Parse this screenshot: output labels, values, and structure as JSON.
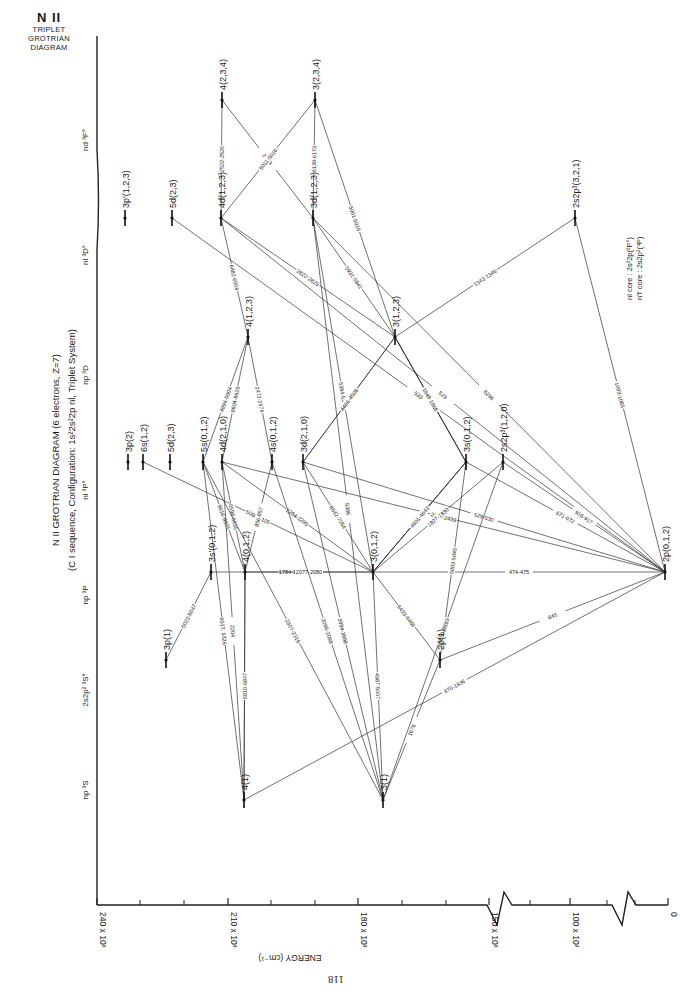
{
  "corner_title": {
    "ion": "N II",
    "line1": "TRIPLET",
    "line2": "GROTRIAN",
    "line3": "DIAGRAM"
  },
  "title": {
    "line1": "N II GROTRIAN DIAGRAM (6 electrons, Z=7)",
    "line2": "(C I sequence, Configuration: 1s²2s²2p nl, Triplet System)"
  },
  "legend_note": {
    "line1": "nl   core : 2s²2p(²P°)",
    "line2": "n'l' core : 2s2p²(⁴P)"
  },
  "page_number": "118",
  "axis": {
    "label": "ENERGY   (cm⁻¹)",
    "ticks": [
      {
        "label": "240 x 10³",
        "x": 97
      },
      {
        "label": "210 x 10³",
        "x": 228
      },
      {
        "label": "180 x 10³",
        "x": 358
      },
      {
        "label": "150 x 10³",
        "x": 489
      },
      {
        "label": "100 x 10³",
        "x": 570
      },
      {
        "label": "0",
        "x": 668
      }
    ],
    "minor_ticks_x": [
      140,
      184,
      271,
      315,
      402,
      446,
      530,
      607,
      635
    ]
  },
  "columns": [
    {
      "label": "np ³S",
      "y": 790
    },
    {
      "label": "2s2p² ³S°",
      "y": 690
    },
    {
      "label": "np ³P",
      "y": 595
    },
    {
      "label": "nl ³P°",
      "y": 490
    },
    {
      "label": "np ³D",
      "y": 375
    },
    {
      "label": "nl ³D°",
      "y": 255
    },
    {
      "label": "nd ³F°",
      "y": 140
    }
  ],
  "chart_data": {
    "type": "grotrian",
    "title": "N II GROTRIAN DIAGRAM (6 electrons, Z=7)",
    "subtitle": "(C I sequence, Configuration: 1s²2s²2p nl, Triplet System)",
    "xlabel": "ENERGY (cm⁻¹)",
    "xlim": [
      240000,
      0
    ],
    "columns": [
      "np ³S",
      "2s2p² ³S°",
      "np ³P",
      "nl ³P°",
      "np ³D",
      "nl ³D°",
      "nd ³F°"
    ],
    "levels": [
      {
        "id": "4F",
        "label": "4(2,3,4)",
        "column": "nd ³F°",
        "x": 222,
        "y": 100
      },
      {
        "id": "3F",
        "label": "3(2,3,4)",
        "column": "nd ³F°",
        "x": 315,
        "y": 100
      },
      {
        "id": "3pp",
        "label": "3p'(1,2,3)",
        "column": "nl ³D°",
        "x": 125,
        "y": 218
      },
      {
        "id": "5dD",
        "label": "5d(2,3)",
        "column": "nl ³D°",
        "x": 172,
        "y": 218
      },
      {
        "id": "4dD",
        "label": "4d(1,2,3)",
        "column": "nl ³D°",
        "x": 221,
        "y": 218
      },
      {
        "id": "3dD",
        "label": "3d(1,2,3)",
        "column": "nl ³D°",
        "x": 313,
        "y": 218
      },
      {
        "id": "2s2p3D",
        "label": "2s2p³(3,2,1)",
        "column": "nl ³D°",
        "x": 575,
        "y": 218
      },
      {
        "id": "4pD",
        "label": "4(1,2,3)",
        "column": "np ³D",
        "x": 248,
        "y": 337
      },
      {
        "id": "3pD",
        "label": "3(1,2,3)",
        "column": "np ³D",
        "x": 395,
        "y": 337
      },
      {
        "id": "3pP",
        "label": "3p(2)",
        "column": "nl ³P°",
        "x": 128,
        "y": 462
      },
      {
        "id": "6s",
        "label": "6s(1,2)",
        "column": "nl ³P°",
        "x": 143,
        "y": 462
      },
      {
        "id": "5dP",
        "label": "5d(2,3)",
        "column": "nl ³P°",
        "x": 170,
        "y": 462
      },
      {
        "id": "5s",
        "label": "5s(0,1,2)",
        "column": "nl ³P°",
        "x": 203,
        "y": 462
      },
      {
        "id": "4dP",
        "label": "4d(2,1,0)",
        "column": "nl ³P°",
        "x": 222,
        "y": 462
      },
      {
        "id": "4s",
        "label": "4s(0,1,2)",
        "column": "nl ³P°",
        "x": 272,
        "y": 462
      },
      {
        "id": "3dP",
        "label": "3d(2,1,0)",
        "column": "nl ³P°",
        "x": 303,
        "y": 462
      },
      {
        "id": "3s",
        "label": "3s(0,1,2)",
        "column": "nl ³P°",
        "x": 466,
        "y": 462
      },
      {
        "id": "2s2p3P",
        "label": "2s2p³(1,2,0)",
        "column": "nl ³P°",
        "x": 503,
        "y": 462
      },
      {
        "id": "3sp",
        "label": "3s'(0,1,2)",
        "column": "np ³P",
        "x": 211,
        "y": 572
      },
      {
        "id": "4pP",
        "label": "4(0,1,2)",
        "column": "np ³P",
        "x": 245,
        "y": 572
      },
      {
        "id": "3pPP",
        "label": "3(0,1,2)",
        "column": "np ³P",
        "x": 373,
        "y": 572
      },
      {
        "id": "2pP",
        "label": "2p(0,1,2)",
        "column": "np ³P",
        "x": 665,
        "y": 572
      },
      {
        "id": "3p1",
        "label": "3p(1)",
        "column": "2s2p² ³S°",
        "x": 166,
        "y": 660
      },
      {
        "id": "2p1",
        "label": "2p(1)",
        "column": "2s2p² ³S°",
        "x": 440,
        "y": 660
      },
      {
        "id": "4S",
        "label": "4(1)",
        "column": "np ³S",
        "x": 244,
        "y": 800
      },
      {
        "id": "3S",
        "label": "3(1)",
        "column": "np ³S",
        "x": 383,
        "y": 800
      }
    ],
    "transitions": [
      {
        "from": "4F",
        "to": "3dD",
        "label": "2509"
      },
      {
        "from": "4F",
        "to": "4dD",
        "label": "2522-2526"
      },
      {
        "from": "3F",
        "to": "3dD",
        "label": "6139-6173"
      },
      {
        "from": "3F",
        "to": "3pD",
        "label": "5001-5016"
      },
      {
        "from": "3F",
        "to": "4dD",
        "label": "5011-5016"
      },
      {
        "from": "5dD",
        "label": "533",
        "to": "2pP"
      },
      {
        "from": "4dD",
        "to": "4pD",
        "label": "6482-6504"
      },
      {
        "from": "4dD",
        "label": "529",
        "to": "2pP"
      },
      {
        "from": "4dD",
        "to": "3pD",
        "label": "2822-2826"
      },
      {
        "from": "3dD",
        "to": "3pD",
        "label": "5931-5941"
      },
      {
        "from": "3dD",
        "to": "3pPP",
        "label": "5384-5391"
      },
      {
        "from": "3dD",
        "to": "3S",
        "label": "5386"
      },
      {
        "from": "3dD",
        "label": "6286",
        "to": "2pP"
      },
      {
        "from": "2s2p3D",
        "to": "2pP",
        "label": "1083-1085"
      },
      {
        "from": "2s2p3D",
        "to": "3pD",
        "label": "1343-1346"
      },
      {
        "from": "4pD",
        "to": "5s",
        "label": "4994-5004"
      },
      {
        "from": "4pD",
        "to": "4dP",
        "label": "8604-8629"
      },
      {
        "from": "4pD",
        "to": "4s",
        "label": "2472-2474"
      },
      {
        "from": "3pD",
        "to": "3dP",
        "label": "2091-2097"
      },
      {
        "from": "3pD",
        "to": "3s",
        "label": "5667-5711"
      },
      {
        "from": "3pD",
        "to": "3dP",
        "label": "4466-4508"
      },
      {
        "from": "3pD",
        "to": "3s",
        "label": "3838-3855"
      },
      {
        "from": "6s",
        "to": "3pPP",
        "label": "5098-5105"
      },
      {
        "from": "5s",
        "to": "4pP",
        "label": "9916-9925"
      },
      {
        "from": "5s",
        "to": "4S",
        "label": "9017, 9326"
      },
      {
        "from": "4dP",
        "to": "4pP",
        "label": "6598-6635"
      },
      {
        "from": "4dP",
        "to": "3pPP",
        "label": "2284-2295"
      },
      {
        "from": "4dP",
        "to": "2pP",
        "label": "2488-2499"
      },
      {
        "from": "4s",
        "to": "4pP",
        "label": "856-857"
      },
      {
        "from": "3dP",
        "to": "3pPP",
        "label": "8642-7054"
      },
      {
        "from": "3dP",
        "to": "2pP",
        "label": "529-530"
      },
      {
        "from": "3s",
        "to": "3pPP",
        "label": "1844-1848"
      },
      {
        "from": "3s",
        "to": "2pP",
        "label": "671-672"
      },
      {
        "from": "3s",
        "to": "3pD",
        "label": "1848-1868"
      },
      {
        "from": "2s2p3P",
        "to": "2pP",
        "label": "916-917"
      },
      {
        "from": "3sp",
        "to": "3p1",
        "label": "5022-5047"
      },
      {
        "from": "3sp",
        "to": "3pPP",
        "label": "1784-1786"
      },
      {
        "from": "4pP",
        "to": "3pPP",
        "label": "2077-2080"
      },
      {
        "from": "4pP",
        "to": "4S",
        "label": "6219"
      },
      {
        "from": "4pP",
        "to": "4S",
        "label": "6810-6847"
      },
      {
        "from": "3pPP",
        "to": "2pP",
        "label": "474-475"
      },
      {
        "from": "3pPP",
        "to": "3s",
        "label": "1075-1277"
      },
      {
        "from": "3pPP",
        "to": "3s",
        "label": "4601-4643"
      },
      {
        "from": "3pPP",
        "to": "2s2p3P",
        "label": "1827-1830"
      },
      {
        "from": "3pPP",
        "to": "2p1",
        "label": "6433-6468"
      },
      {
        "from": "3pPP",
        "to": "3S",
        "label": "4987-5007"
      },
      {
        "from": "2p1",
        "to": "2pP",
        "label": "645"
      },
      {
        "from": "2p1",
        "to": "3S",
        "label": "1676"
      },
      {
        "from": "2p1",
        "to": "3s",
        "label": "5003-5045"
      },
      {
        "from": "3S",
        "to": "2s2p3P",
        "label": "8850-8893"
      },
      {
        "from": "4S",
        "to": "2pP",
        "label": "870-1836"
      },
      {
        "from": "4S",
        "to": "4dP",
        "label": "2204"
      },
      {
        "from": "3S",
        "to": "4s",
        "label": "2096-2098"
      },
      {
        "from": "3S",
        "to": "3dP",
        "label": "3994-3998"
      },
      {
        "from": "3S",
        "to": "5s",
        "label": "2307-2316"
      }
    ]
  }
}
